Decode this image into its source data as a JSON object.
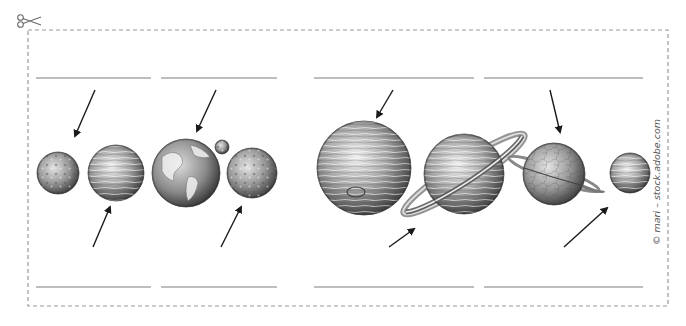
{
  "worksheet": {
    "type": "cut-out planet labeling worksheet",
    "credit": "© mari – stock.adobe.com",
    "colors": {
      "border": "#9a9a9a",
      "line": "#a8a8a8",
      "arrow": "#1a1a1a",
      "planet_dark": "#3a3a3a",
      "planet_light": "#e6e6e6"
    },
    "scissors_icon": "scissors-icon",
    "answer_lines": {
      "top": [
        {
          "x1": 36,
          "x2": 151,
          "y": 78
        },
        {
          "x1": 161,
          "x2": 277,
          "y": 78
        },
        {
          "x1": 314,
          "x2": 474,
          "y": 78
        },
        {
          "x1": 484,
          "x2": 643,
          "y": 78
        }
      ],
      "bottom": [
        {
          "x1": 36,
          "x2": 151,
          "y": 287
        },
        {
          "x1": 161,
          "x2": 277,
          "y": 287
        },
        {
          "x1": 314,
          "x2": 474,
          "y": 287
        },
        {
          "x1": 484,
          "x2": 643,
          "y": 287
        }
      ]
    },
    "planets": [
      {
        "name": "mercury",
        "cx": 58,
        "cy": 173,
        "r": 21
      },
      {
        "name": "venus",
        "cx": 116,
        "cy": 173,
        "r": 28
      },
      {
        "name": "earth",
        "cx": 186,
        "cy": 173,
        "r": 34
      },
      {
        "name": "moon",
        "cx": 222,
        "cy": 147,
        "r": 7
      },
      {
        "name": "mars",
        "cx": 252,
        "cy": 173,
        "r": 25
      },
      {
        "name": "jupiter",
        "cx": 364,
        "cy": 168,
        "r": 47
      },
      {
        "name": "saturn",
        "cx": 464,
        "cy": 174,
        "r": 40
      },
      {
        "name": "uranus",
        "cx": 554,
        "cy": 174,
        "r": 31
      },
      {
        "name": "neptune",
        "cx": 630,
        "cy": 173,
        "r": 20
      }
    ],
    "arrows": [
      {
        "target": "mercury",
        "x1": 95,
        "y1": 90,
        "x2": 75,
        "y2": 136
      },
      {
        "target": "earth",
        "x1": 216,
        "y1": 90,
        "x2": 197,
        "y2": 131
      },
      {
        "target": "venus",
        "x1": 93,
        "y1": 247,
        "x2": 110,
        "y2": 207
      },
      {
        "target": "mars",
        "x1": 221,
        "y1": 247,
        "x2": 241,
        "y2": 207
      },
      {
        "target": "jupiter",
        "x1": 393,
        "y1": 90,
        "x2": 377,
        "y2": 117
      },
      {
        "target": "uranus",
        "x1": 550,
        "y1": 90,
        "x2": 560,
        "y2": 132
      },
      {
        "target": "saturn",
        "x1": 389,
        "y1": 247,
        "x2": 414,
        "y2": 229
      },
      {
        "target": "neptune",
        "x1": 564,
        "y1": 247,
        "x2": 607,
        "y2": 208
      }
    ]
  }
}
